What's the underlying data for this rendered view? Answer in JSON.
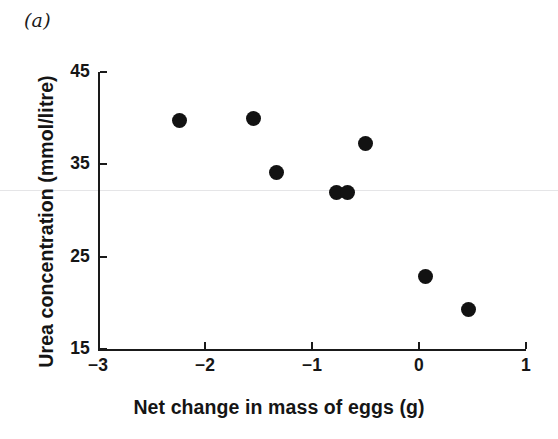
{
  "figure": {
    "panel_label": "(a)",
    "background_color": "#ffffff",
    "marker_color": "#121212",
    "axis_color": "#1a1a1a"
  },
  "chart_data": {
    "type": "scatter",
    "title": "",
    "subtitle": "",
    "panel": "(a)",
    "xlabel": "Net change in mass of eggs (g)",
    "ylabel": "Urea concentration (mmol/litre)",
    "xlim": [
      -3,
      1
    ],
    "ylim": [
      15,
      45
    ],
    "xticks": [
      -3,
      -2,
      -1,
      0,
      1
    ],
    "xtick_labels": [
      "−3",
      "−2",
      "−1",
      "0",
      "1"
    ],
    "yticks": [
      15,
      25,
      35,
      45
    ],
    "ytick_labels": [
      "15",
      "25",
      "35",
      "45"
    ],
    "grid": false,
    "legend": null,
    "legend_position": "none",
    "marker": "filled-circle",
    "marker_size_px": 15,
    "n_points": 8,
    "x": [
      -2.24,
      -1.55,
      -1.33,
      -0.77,
      -0.67,
      -0.5,
      0.06,
      0.46
    ],
    "y": [
      39.7,
      40.0,
      34.1,
      32.0,
      31.9,
      37.3,
      22.9,
      19.3
    ],
    "points": [
      {
        "x": -2.24,
        "y": 39.7
      },
      {
        "x": -1.55,
        "y": 40.0
      },
      {
        "x": -1.33,
        "y": 34.1
      },
      {
        "x": -0.77,
        "y": 32.0
      },
      {
        "x": -0.67,
        "y": 31.9
      },
      {
        "x": -0.5,
        "y": 37.3
      },
      {
        "x": 0.06,
        "y": 22.9
      },
      {
        "x": 0.46,
        "y": 19.3
      }
    ]
  }
}
